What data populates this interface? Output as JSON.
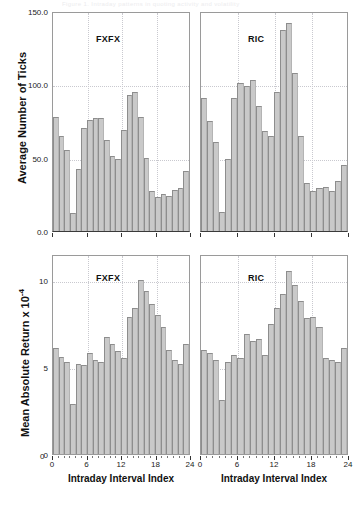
{
  "figure": {
    "header_strip": "Figure 1.  Intraday patterns in quoting activity and volatility"
  },
  "chart_data": [
    {
      "id": "ticks-fxfx",
      "type": "bar",
      "title": "",
      "series_label": "FXFX",
      "xlabel": "Intraday Interval Index",
      "ylabel": "Average Number of Ticks",
      "xlim": [
        0,
        24
      ],
      "ylim": [
        0,
        150
      ],
      "yticks": [
        0,
        50,
        100,
        150
      ],
      "ytick_labels": [
        "0.0",
        "50.0",
        "100.0",
        "150.0"
      ],
      "xticks": [
        0,
        6,
        12,
        18,
        24
      ],
      "xtick_labels": [
        "0",
        "6",
        "12",
        "18",
        "24"
      ],
      "grid": true,
      "categories": [
        1,
        2,
        3,
        4,
        5,
        6,
        7,
        8,
        9,
        10,
        11,
        12,
        13,
        14,
        15,
        16,
        17,
        18,
        19,
        20,
        21,
        22,
        23,
        24
      ],
      "values": [
        78,
        65,
        55,
        12,
        42,
        70,
        76,
        77,
        77,
        62,
        51,
        49,
        69,
        93,
        95,
        78,
        50,
        27,
        23,
        25,
        24,
        28,
        29,
        41
      ]
    },
    {
      "id": "ticks-ric",
      "type": "bar",
      "title": "",
      "series_label": "RIC",
      "xlabel": "Intraday Interval Index",
      "ylabel": "Average Number of Ticks",
      "xlim": [
        0,
        24
      ],
      "ylim": [
        0,
        150
      ],
      "yticks": [
        0,
        50,
        100,
        150
      ],
      "ytick_labels": [
        "0.0",
        "50.0",
        "100.0",
        "150.0"
      ],
      "xticks": [
        0,
        6,
        12,
        18,
        24
      ],
      "xtick_labels": [
        "0",
        "6",
        "12",
        "18",
        "24"
      ],
      "grid": true,
      "categories": [
        1,
        2,
        3,
        4,
        5,
        6,
        7,
        8,
        9,
        10,
        11,
        12,
        13,
        14,
        15,
        16,
        17,
        18,
        19,
        20,
        21,
        22,
        23,
        24
      ],
      "values": [
        91,
        75,
        61,
        13,
        49,
        91,
        101,
        99,
        103,
        85,
        68,
        65,
        95,
        137,
        142,
        108,
        65,
        33,
        27,
        29,
        30,
        27,
        34,
        45
      ]
    },
    {
      "id": "mar-fxfx",
      "type": "bar",
      "title": "",
      "series_label": "FXFX",
      "xlabel": "Intraday Interval Index",
      "ylabel": "Mean Absolute Return x 10^-4",
      "xlim": [
        0,
        24
      ],
      "ylim": [
        0,
        11.5
      ],
      "yticks": [
        0,
        5,
        10
      ],
      "ytick_labels": [
        "0",
        "5",
        "10"
      ],
      "xticks": [
        0,
        6,
        12,
        18,
        24
      ],
      "xtick_labels": [
        "0",
        "6",
        "12",
        "18",
        "24"
      ],
      "grid": true,
      "categories": [
        1,
        2,
        3,
        4,
        5,
        6,
        7,
        8,
        9,
        10,
        11,
        12,
        13,
        14,
        15,
        16,
        17,
        18,
        19,
        20,
        21,
        22,
        23,
        24
      ],
      "values": [
        6.1,
        5.6,
        5.3,
        2.9,
        5.2,
        5.1,
        5.8,
        5.4,
        5.3,
        6.7,
        6.3,
        5.9,
        5.5,
        7.9,
        8.4,
        10.0,
        9.4,
        8.6,
        8.0,
        7.3,
        6.0,
        5.4,
        5.2,
        6.3
      ]
    },
    {
      "id": "mar-ric",
      "type": "bar",
      "title": "",
      "series_label": "RIC",
      "xlabel": "Intraday Interval Index",
      "ylabel": "Mean Absolute Return x 10^-4",
      "xlim": [
        0,
        24
      ],
      "ylim": [
        0,
        11.5
      ],
      "yticks": [
        0,
        5,
        10
      ],
      "ytick_labels": [
        "0",
        "5",
        "10"
      ],
      "xticks": [
        0,
        6,
        12,
        18,
        24
      ],
      "xtick_labels": [
        "0",
        "6",
        "12",
        "18",
        "24"
      ],
      "grid": true,
      "categories": [
        1,
        2,
        3,
        4,
        5,
        6,
        7,
        8,
        9,
        10,
        11,
        12,
        13,
        14,
        15,
        16,
        17,
        18,
        19,
        20,
        21,
        22,
        23,
        24
      ],
      "values": [
        6.0,
        5.8,
        5.4,
        3.1,
        5.3,
        5.7,
        5.5,
        6.9,
        6.5,
        6.6,
        5.7,
        7.5,
        8.4,
        9.2,
        10.5,
        9.7,
        8.8,
        7.8,
        7.9,
        7.3,
        5.5,
        5.4,
        5.3,
        6.1
      ]
    }
  ],
  "axes": {
    "y_title_top": "Average Number of Ticks",
    "y_title_bottom_pre": "Mean Absolute Return x 10",
    "y_title_bottom_sup": "-4",
    "x_title": "Intraday Interval Index"
  }
}
